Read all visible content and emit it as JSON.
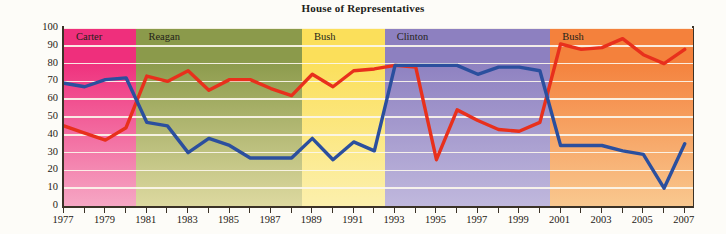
{
  "title": "House of Representatives",
  "axes": {
    "ylabel": "f President's Position",
    "yticks": [
      0,
      10,
      20,
      30,
      40,
      50,
      60,
      70,
      80,
      90,
      100
    ],
    "xticks_labeled": [
      1977,
      1979,
      1981,
      1983,
      1985,
      1987,
      1989,
      1991,
      1993,
      1995,
      1997,
      1999,
      2001,
      2003,
      2005,
      2007
    ]
  },
  "eras": [
    {
      "label": "Carter",
      "start": 1977,
      "end": 1980.5,
      "color_from": "#ef2f7c",
      "color_to": "#f6a7c4"
    },
    {
      "label": "Reagan",
      "start": 1980.5,
      "end": 1988.5,
      "color_from": "#8b9a4b",
      "color_to": "#ddd9a0"
    },
    {
      "label": "Bush",
      "start": 1988.5,
      "end": 1992.5,
      "color_from": "#fbdf5a",
      "color_to": "#fcf0ad"
    },
    {
      "label": "Clinton",
      "start": 1992.5,
      "end": 2000.5,
      "color_from": "#8d80c0",
      "color_to": "#c0b8dd"
    },
    {
      "label": "Bush",
      "start": 2000.5,
      "end": 2007.4,
      "color_from": "#f4813c",
      "color_to": "#f9c88f"
    }
  ],
  "colors": {
    "series_red": "#e8301c",
    "series_blue": "#2b4f9e",
    "gridline": "#fbf6ec",
    "axis": "#3b3227",
    "title_text": "#221d18",
    "page_background": "#fdfcf8"
  },
  "chart_data": {
    "type": "line",
    "title": "House of Representatives",
    "xlabel": "",
    "ylabel": "f President's Position",
    "xlim": [
      1977,
      2007
    ],
    "ylim": [
      0,
      100
    ],
    "grid": true,
    "legend": "none",
    "x": [
      1977,
      1978,
      1979,
      1980,
      1981,
      1982,
      1983,
      1984,
      1985,
      1986,
      1987,
      1988,
      1989,
      1990,
      1991,
      1992,
      1993,
      1994,
      1995,
      1996,
      1997,
      1998,
      1999,
      2000,
      2001,
      2002,
      2003,
      2004,
      2005,
      2006,
      2007
    ],
    "series": [
      {
        "name": "red",
        "color": "#e8301c",
        "values": [
          45,
          41,
          37,
          44,
          73,
          70,
          76,
          65,
          71,
          71,
          66,
          62,
          74,
          67,
          76,
          77,
          79,
          78,
          26,
          54,
          48,
          43,
          42,
          47,
          91,
          88,
          89,
          94,
          85,
          80,
          88
        ]
      },
      {
        "name": "blue",
        "color": "#2b4f9e",
        "values": [
          69,
          67,
          71,
          72,
          47,
          45,
          30,
          38,
          34,
          27,
          27,
          27,
          38,
          26,
          36,
          31,
          79,
          79,
          79,
          79,
          74,
          78,
          78,
          76,
          34,
          34,
          34,
          31,
          29,
          10,
          35
        ]
      }
    ]
  }
}
